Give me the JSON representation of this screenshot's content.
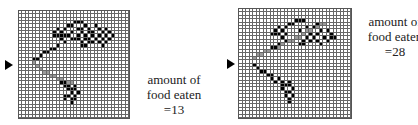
{
  "figure": {
    "grid_size": 32,
    "panels": [
      {
        "id": "panel-1",
        "caption": [
          "amount of",
          "food eaten",
          "=13"
        ],
        "caption_label": "amount of food eaten",
        "food_eaten": 13,
        "food_cells": [
          [
            3,
            16
          ],
          [
            3,
            17
          ],
          [
            3,
            18
          ],
          [
            4,
            14
          ],
          [
            4,
            15
          ],
          [
            4,
            19
          ],
          [
            4,
            22
          ],
          [
            5,
            11
          ],
          [
            5,
            13
          ],
          [
            5,
            17
          ],
          [
            5,
            18
          ],
          [
            5,
            20
          ],
          [
            5,
            23
          ],
          [
            5,
            25
          ],
          [
            6,
            10
          ],
          [
            6,
            12
          ],
          [
            6,
            15
          ],
          [
            6,
            18
          ],
          [
            6,
            20
          ],
          [
            6,
            21
          ],
          [
            6,
            24
          ],
          [
            6,
            26
          ],
          [
            7,
            10
          ],
          [
            7,
            11
          ],
          [
            7,
            12
          ],
          [
            7,
            13
          ],
          [
            7,
            14
          ],
          [
            7,
            17
          ],
          [
            7,
            19
          ],
          [
            7,
            21
          ],
          [
            7,
            23
          ],
          [
            7,
            25
          ],
          [
            7,
            27
          ],
          [
            8,
            12
          ],
          [
            8,
            15
          ],
          [
            8,
            16
          ],
          [
            8,
            17
          ],
          [
            8,
            19
          ],
          [
            8,
            20
          ],
          [
            8,
            22
          ],
          [
            8,
            24
          ],
          [
            8,
            26
          ],
          [
            9,
            13
          ],
          [
            9,
            18
          ],
          [
            9,
            20
          ],
          [
            9,
            21
          ],
          [
            9,
            23
          ],
          [
            9,
            25
          ],
          [
            10,
            11
          ],
          [
            10,
            18
          ],
          [
            10,
            19
          ],
          [
            10,
            24
          ],
          [
            11,
            9
          ],
          [
            11,
            10
          ],
          [
            12,
            7
          ],
          [
            12,
            8
          ],
          [
            13,
            6
          ],
          [
            14,
            5
          ],
          [
            14,
            4
          ],
          [
            21,
            12
          ],
          [
            21,
            13
          ],
          [
            22,
            13
          ],
          [
            22,
            14
          ],
          [
            22,
            16
          ],
          [
            23,
            14
          ],
          [
            23,
            15
          ],
          [
            23,
            16
          ],
          [
            24,
            15
          ],
          [
            24,
            17
          ],
          [
            25,
            13
          ],
          [
            25,
            14
          ],
          [
            25,
            16
          ],
          [
            26,
            13
          ],
          [
            26,
            15
          ],
          [
            26,
            16
          ],
          [
            27,
            15
          ]
        ],
        "path_cells": [
          [
            15,
            4
          ],
          [
            16,
            5
          ],
          [
            17,
            6
          ],
          [
            18,
            7
          ],
          [
            18,
            8
          ],
          [
            19,
            9
          ],
          [
            19,
            10
          ],
          [
            20,
            11
          ],
          [
            20,
            12
          ],
          [
            21,
            14
          ],
          [
            21,
            15
          ]
        ],
        "entry_row": 15
      },
      {
        "id": "panel-2",
        "caption": [
          "amount of",
          "food eaten",
          "=28"
        ],
        "caption_label": "amount of food eaten",
        "food_eaten": 28,
        "food_cells": [
          [
            3,
            16
          ],
          [
            3,
            17
          ],
          [
            3,
            18
          ],
          [
            4,
            14
          ],
          [
            4,
            15
          ],
          [
            4,
            22
          ],
          [
            5,
            11
          ],
          [
            5,
            13
          ],
          [
            5,
            19
          ],
          [
            5,
            21
          ],
          [
            6,
            10
          ],
          [
            6,
            12
          ],
          [
            6,
            17
          ],
          [
            6,
            23
          ],
          [
            6,
            25
          ],
          [
            7,
            9
          ],
          [
            7,
            10
          ],
          [
            7,
            11
          ],
          [
            7,
            13
          ],
          [
            7,
            20
          ],
          [
            7,
            22
          ],
          [
            7,
            26
          ],
          [
            8,
            12
          ],
          [
            8,
            19
          ],
          [
            8,
            21
          ],
          [
            8,
            24
          ],
          [
            8,
            26
          ],
          [
            8,
            27
          ],
          [
            9,
            13
          ],
          [
            9,
            18
          ],
          [
            9,
            20
          ],
          [
            9,
            22
          ],
          [
            9,
            25
          ],
          [
            10,
            11
          ],
          [
            10,
            17
          ],
          [
            10,
            18
          ],
          [
            10,
            23
          ],
          [
            11,
            9
          ],
          [
            11,
            10
          ],
          [
            16,
            4
          ],
          [
            17,
            5
          ],
          [
            18,
            6
          ],
          [
            18,
            7
          ],
          [
            19,
            8
          ],
          [
            19,
            9
          ],
          [
            20,
            9
          ],
          [
            20,
            11
          ],
          [
            21,
            10
          ],
          [
            21,
            12
          ],
          [
            21,
            14
          ],
          [
            22,
            12
          ],
          [
            22,
            13
          ],
          [
            22,
            14
          ],
          [
            23,
            12
          ],
          [
            23,
            15
          ],
          [
            24,
            13
          ],
          [
            24,
            14
          ],
          [
            25,
            13
          ],
          [
            25,
            15
          ],
          [
            26,
            14
          ],
          [
            27,
            14
          ]
        ],
        "path_cells": [
          [
            14,
            4
          ],
          [
            13,
            5
          ],
          [
            13,
            6
          ],
          [
            12,
            7
          ],
          [
            12,
            8
          ],
          [
            11,
            11
          ],
          [
            10,
            12
          ],
          [
            9,
            14
          ],
          [
            9,
            15
          ],
          [
            8,
            16
          ],
          [
            8,
            17
          ],
          [
            7,
            18
          ],
          [
            6,
            19
          ],
          [
            6,
            20
          ],
          [
            5,
            21
          ],
          [
            5,
            22
          ],
          [
            4,
            23
          ],
          [
            4,
            24
          ]
        ],
        "entry_row": 15
      }
    ]
  },
  "colors": {
    "food": "#000000",
    "path": "#9a9a9a",
    "grid_line": "#666666"
  }
}
